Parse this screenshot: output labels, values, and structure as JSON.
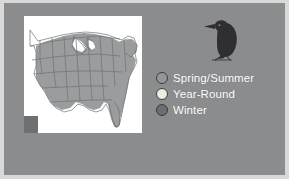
{
  "figure": {
    "background_color": "#8a8c8e",
    "frame_color": "#d9d9d9",
    "title": ""
  },
  "map": {
    "name": "range-map-eastern-united-states",
    "panel_background": "#ffffff",
    "state_outline_color": "#6f7173",
    "range_fill_color": "#9a9c9e",
    "unshaded_fill_color": "#ffffff",
    "corner_block_color": "#6e7072",
    "description": "Map of the eastern and central United States with range shading over the eastern states"
  },
  "bird": {
    "name": "bird-silhouette",
    "color": "#2f2f31",
    "description": "Dark silhouette of a perched woodpecker facing left"
  },
  "legend": {
    "items": [
      {
        "label": "Spring/Summer",
        "color": "#949698",
        "icon": "circle-icon"
      },
      {
        "label": "Year-Round",
        "color": "#ececdf",
        "icon": "circle-icon"
      },
      {
        "label": "Winter",
        "color": "#6b6d6f",
        "icon": "circle-icon"
      }
    ],
    "label_color": "#ffffff",
    "swatch_border_color": "#3a3c3e"
  }
}
